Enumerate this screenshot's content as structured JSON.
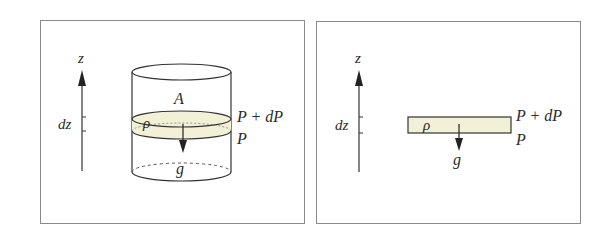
{
  "colors": {
    "background": "#ffffff",
    "frame": "#8a8a8a",
    "line": "#333333",
    "slab_fill": "#f2f0d6"
  },
  "panels": [
    {
      "id": "cylinder-panel",
      "labels": {
        "axis": "z",
        "thickness": "dz",
        "area": "A",
        "density": "ρ",
        "top_pressure": "P + dP",
        "bottom_pressure": "P",
        "gravity": "g"
      }
    },
    {
      "id": "slab-panel",
      "labels": {
        "axis": "z",
        "thickness": "dz",
        "density": "ρ",
        "top_pressure": "P + dP",
        "bottom_pressure": "P",
        "gravity": "g"
      }
    }
  ]
}
